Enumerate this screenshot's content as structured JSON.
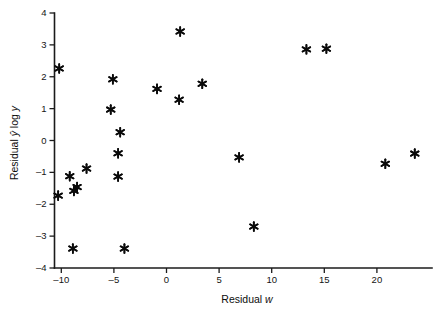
{
  "chart_data": {
    "type": "scatter",
    "title": "",
    "xlabel": "Residual w",
    "xlabel_parts": {
      "prefix": "Residual ",
      "italic": "w"
    },
    "ylabel": "Residual ŷ log y",
    "ylabel_parts": {
      "prefix": "Residual ",
      "italic1": "ŷ",
      "mid": " log ",
      "italic2": "y"
    },
    "xlim": [
      -12,
      26
    ],
    "ylim": [
      -4,
      4
    ],
    "xticks": [
      -10,
      -5,
      0,
      5,
      10,
      15,
      20
    ],
    "xtick_labels": [
      "–10",
      "–5",
      "0",
      "5",
      "10",
      "15",
      "20"
    ],
    "yticks": [
      -4,
      -3,
      -2,
      -1,
      0,
      1,
      2,
      3,
      4
    ],
    "ytick_labels": [
      "–4",
      "–3",
      "–2",
      "–1",
      "0",
      "1",
      "2",
      "3",
      "4"
    ],
    "grid": false,
    "legend": null,
    "marker_style": "asterisk",
    "marker_color": "#0a0a0a",
    "point_count": 23,
    "points": [
      {
        "x": -10.2,
        "y": 2.26
      },
      {
        "x": -10.3,
        "y": -1.73
      },
      {
        "x": -9.2,
        "y": -1.12
      },
      {
        "x": -8.9,
        "y": -3.39
      },
      {
        "x": -8.8,
        "y": -1.58
      },
      {
        "x": -8.5,
        "y": -1.46
      },
      {
        "x": -7.6,
        "y": -0.88
      },
      {
        "x": -5.3,
        "y": 0.97
      },
      {
        "x": -5.1,
        "y": 1.92
      },
      {
        "x": -4.6,
        "y": -0.4
      },
      {
        "x": -4.6,
        "y": -1.13
      },
      {
        "x": -4.4,
        "y": 0.26
      },
      {
        "x": -4.0,
        "y": -3.39
      },
      {
        "x": -0.9,
        "y": 1.62
      },
      {
        "x": 1.2,
        "y": 1.28
      },
      {
        "x": 1.3,
        "y": 3.42
      },
      {
        "x": 3.4,
        "y": 1.78
      },
      {
        "x": 6.9,
        "y": -0.53
      },
      {
        "x": 8.3,
        "y": -2.7
      },
      {
        "x": 13.3,
        "y": 2.86
      },
      {
        "x": 15.2,
        "y": 2.88
      },
      {
        "x": 20.8,
        "y": -0.73
      },
      {
        "x": 23.6,
        "y": -0.41
      }
    ]
  },
  "figure": {
    "background": "#ffffff",
    "axis_color": "#1b1b1b",
    "text_color": "#141414"
  }
}
